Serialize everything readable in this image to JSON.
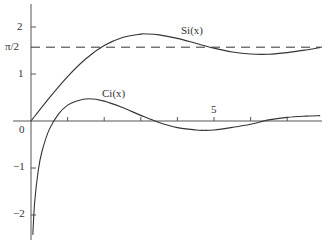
{
  "chart_data": {
    "type": "line",
    "title": "",
    "xlabel": "",
    "ylabel": "",
    "xlim": [
      0,
      8
    ],
    "ylim": [
      -2.5,
      2.5
    ],
    "x_ticks": [
      1,
      2,
      3,
      4,
      5,
      6,
      7
    ],
    "x_tick_labels": {
      "5": "5"
    },
    "y_ticks": [
      -2,
      -1,
      1,
      2
    ],
    "y_tick_labels": [
      "−2",
      "−1",
      "1",
      "2"
    ],
    "origin_label": "0",
    "reference_line": {
      "y": 1.5708,
      "label": "π/2",
      "style": "dashed"
    },
    "series": [
      {
        "name": "Si(x)",
        "x": [
          0,
          0.5,
          1,
          1.5,
          2,
          2.5,
          3,
          3.1416,
          3.5,
          4,
          4.5,
          5,
          5.5,
          6,
          6.5,
          7,
          7.5,
          7.9
        ],
        "values": [
          0,
          0.4931,
          0.9461,
          1.3247,
          1.6054,
          1.7785,
          1.8487,
          1.8519,
          1.8331,
          1.7582,
          1.6541,
          1.5499,
          1.4687,
          1.4247,
          1.4206,
          1.4546,
          1.5107,
          1.5645
        ]
      },
      {
        "name": "Ci(x)",
        "x": [
          0.05,
          0.1,
          0.2,
          0.3,
          0.5,
          0.75,
          1,
          1.25,
          1.5708,
          2,
          2.5,
          3,
          3.5,
          4,
          4.5,
          4.7124,
          5,
          5.5,
          6,
          6.5,
          7,
          7.5,
          7.9
        ],
        "values": [
          -2.4205,
          -1.7279,
          -1.0422,
          -0.6492,
          -0.1778,
          0.1459,
          0.3374,
          0.4258,
          0.472,
          0.423,
          0.2859,
          0.1196,
          -0.0321,
          -0.141,
          -0.19,
          -0.1984,
          -0.19,
          -0.1349,
          -0.0681,
          0.0234,
          0.0767,
          0.1032,
          0.1145
        ]
      }
    ],
    "annotations": [
      {
        "text": "Si(x)",
        "x": 4.3,
        "y": 2.1
      },
      {
        "text": "Ci(x)",
        "x": 2.1,
        "y": 0.65
      }
    ]
  },
  "labels": {
    "si": "Si(x)",
    "ci": "Ci(x)",
    "pi_half": "π/2",
    "y2": "2",
    "y1": "1",
    "y0": "0",
    "ym1": "−1",
    "ym2": "−2",
    "x5": "5"
  }
}
